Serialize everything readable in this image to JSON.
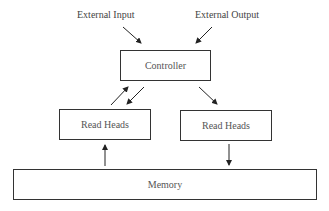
{
  "diagram": {
    "external_input": "External Input",
    "external_output": "External Output",
    "controller": "Controller",
    "read_heads_left": "Read Heads",
    "read_heads_right": "Read Heads",
    "memory": "Memory"
  },
  "edges": [
    {
      "from": "External Input",
      "to": "Controller"
    },
    {
      "from": "External Output",
      "to": "Controller"
    },
    {
      "from": "Read Heads (left)",
      "to": "Controller"
    },
    {
      "from": "Controller",
      "to": "Read Heads (left)"
    },
    {
      "from": "Controller",
      "to": "Read Heads (right)"
    },
    {
      "from": "Memory",
      "to": "Read Heads (left)"
    },
    {
      "from": "Read Heads (right)",
      "to": "Memory"
    }
  ]
}
